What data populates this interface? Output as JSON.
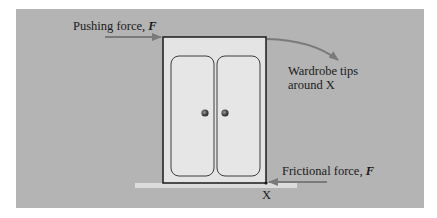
{
  "diagram": {
    "push_label": {
      "text": "Pushing force, ",
      "symbol": "F"
    },
    "tips_label": {
      "line1": "Wardrobe tips",
      "line2": "around X"
    },
    "friction_label": {
      "text": "Frictional force, ",
      "symbol": "F"
    },
    "pivot_label": "X",
    "colors": {
      "background": "#b4b4b4",
      "wardrobe_fill": "#e4e4e4",
      "floor": "#dcdcdc",
      "arrow": "#7a7a7a",
      "outline": "#1a1a1a"
    }
  }
}
